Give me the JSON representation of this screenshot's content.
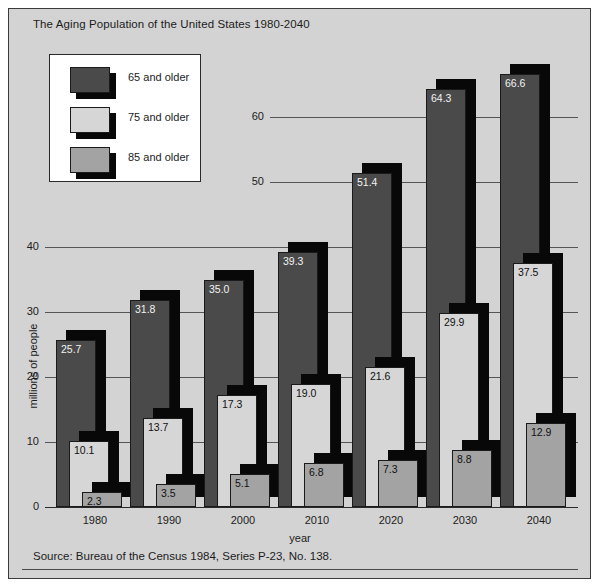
{
  "figure": {
    "title": "The Aging Population of the United States 1980-2040",
    "source": "Source: Bureau of the Census 1984, Series P-23, No. 138.",
    "background_color": "#d3d3d3",
    "frame_color": "#3a3a3a"
  },
  "legend": {
    "position": "top-left",
    "entries": [
      {
        "label": "65 and older",
        "color": "#4a4a4a"
      },
      {
        "label": "75 and older",
        "color": "#d6d6d6"
      },
      {
        "label": "85 and older",
        "color": "#a3a3a3"
      }
    ]
  },
  "chart_data": {
    "type": "bar",
    "title": "The Aging Population of the United States 1980-2040",
    "xlabel": "year",
    "ylabel": "millions of people",
    "categories": [
      "1980",
      "1990",
      "2000",
      "2010",
      "2020",
      "2030",
      "2040"
    ],
    "yticks": [
      0,
      10,
      20,
      30,
      40,
      50,
      60
    ],
    "ylim": [
      0,
      70
    ],
    "grid": true,
    "legend_position": "upper left",
    "series": [
      {
        "name": "65 and older",
        "color": "#4a4a4a",
        "values": [
          25.7,
          31.8,
          35.0,
          39.3,
          51.4,
          64.3,
          66.6
        ],
        "labels": [
          "25.7",
          "31.8",
          "35.0",
          "39.3",
          "51.4",
          "64.3",
          "66.6"
        ]
      },
      {
        "name": "75 and older",
        "color": "#d6d6d6",
        "values": [
          10.1,
          13.7,
          17.3,
          19.0,
          21.6,
          29.9,
          37.5
        ],
        "labels": [
          "10.1",
          "13.7",
          "17.3",
          "19.0",
          "21.6",
          "29.9",
          "37.5"
        ]
      },
      {
        "name": "85 and older",
        "color": "#a3a3a3",
        "values": [
          2.3,
          3.5,
          5.1,
          6.8,
          7.3,
          8.8,
          12.9
        ],
        "labels": [
          "2.3",
          "3.5",
          "5.1",
          "6.8",
          "7.3",
          "8.8",
          "12.9"
        ]
      }
    ]
  }
}
